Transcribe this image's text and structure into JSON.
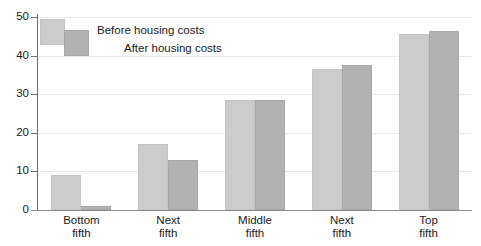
{
  "chart_data": {
    "type": "bar",
    "title": "",
    "xlabel": "",
    "ylabel": "",
    "ylim": [
      0,
      50
    ],
    "yticks": [
      0,
      10,
      20,
      30,
      40,
      50
    ],
    "grid": true,
    "legend_position": "top-left",
    "categories": [
      "Bottom fifth",
      "Next fifth",
      "Middle fifth",
      "Next fifth",
      "Top fifth"
    ],
    "category_lines": [
      [
        "Bottom",
        "fifth"
      ],
      [
        "Next",
        "fifth"
      ],
      [
        "Middle",
        "fifth"
      ],
      [
        "Next",
        "fifth"
      ],
      [
        "Top",
        "fifth"
      ]
    ],
    "series": [
      {
        "name": "Before housing costs",
        "color": "#cccccc",
        "values": [
          9,
          17,
          28.5,
          36.5,
          45.5
        ]
      },
      {
        "name": "After housing costs",
        "color": "#b2b2b2",
        "values": [
          1,
          13,
          28.5,
          37.5,
          46.5
        ]
      }
    ]
  },
  "axis": {
    "tick_labels": [
      "0",
      "10",
      "20",
      "30",
      "40",
      "50"
    ]
  },
  "legend": {
    "before_label": "Before housing costs",
    "after_label": "After housing costs",
    "before_color": "#cccccc",
    "after_color": "#b2b2b2"
  },
  "colors": {
    "before": "#cccccc",
    "after": "#b2b2b2",
    "axis": "#6e6e6e",
    "grid": "#e8e8e8",
    "text": "#1a1a1a",
    "background": "#ffffff"
  }
}
